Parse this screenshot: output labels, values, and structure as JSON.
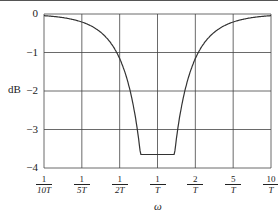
{
  "chart_data": {
    "type": "line",
    "title": "",
    "xlabel": "ω",
    "ylabel": "dB",
    "ylim": [
      -4,
      0
    ],
    "grid": true,
    "x_ticks": [
      {
        "num": "1",
        "den": "10T"
      },
      {
        "num": "1",
        "den": "5T"
      },
      {
        "num": "1",
        "den": "2T"
      },
      {
        "num": "1",
        "den": "T"
      },
      {
        "num": "2",
        "den": "T"
      },
      {
        "num": "5",
        "den": "T"
      },
      {
        "num": "10",
        "den": "T"
      }
    ],
    "y_ticks": [
      "0",
      "−1",
      "−2",
      "−3",
      "−4"
    ],
    "series": [
      {
        "name": "notch magnitude",
        "x_tick_index": [
          0,
          0.5,
          1,
          1.5,
          2,
          2.5,
          2.8,
          3,
          3.2,
          3.5,
          4,
          4.5,
          5,
          5.5,
          6
        ],
        "values": [
          0,
          -0.2,
          -0.4,
          -0.65,
          -0.95,
          -1.5,
          -2.3,
          -3.6,
          -2.3,
          -1.5,
          -0.95,
          -0.65,
          -0.4,
          -0.2,
          0
        ]
      }
    ]
  },
  "labels": {
    "y_axis": "dB",
    "x_axis": "ω"
  }
}
